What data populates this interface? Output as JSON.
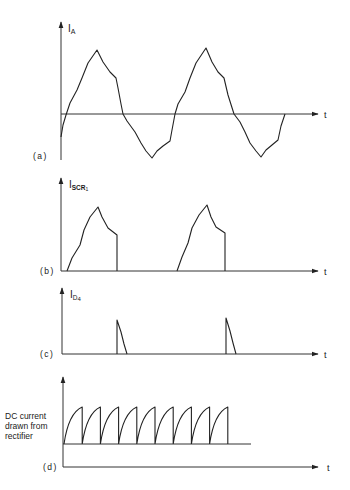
{
  "figure": {
    "panels": [
      {
        "id": "a",
        "tag": "(a)",
        "y_label": "I",
        "y_label_sub": "A",
        "x_label": "t",
        "description": "AC line current, quasi-sinusoidal with step notches, two cycles",
        "path": [
          [
            61,
            137
          ],
          [
            63,
            125
          ],
          [
            66,
            115
          ],
          [
            70,
            103
          ],
          [
            77,
            90
          ],
          [
            82,
            78
          ],
          [
            88,
            63
          ],
          [
            97,
            50
          ],
          [
            103,
            62
          ],
          [
            110,
            72
          ],
          [
            116,
            78
          ],
          [
            118,
            88
          ],
          [
            121,
            104
          ],
          [
            123,
            114
          ],
          [
            127,
            121
          ],
          [
            135,
            132
          ],
          [
            141,
            143
          ],
          [
            146,
            151
          ],
          [
            152,
            158
          ],
          [
            157,
            151
          ],
          [
            163,
            146
          ],
          [
            170,
            141
          ],
          [
            172,
            130
          ],
          [
            175,
            114
          ],
          [
            178,
            104
          ],
          [
            185,
            92
          ],
          [
            190,
            78
          ],
          [
            196,
            63
          ],
          [
            206,
            48
          ],
          [
            212,
            62
          ],
          [
            218,
            72
          ],
          [
            224,
            78
          ],
          [
            228,
            95
          ],
          [
            234,
            114
          ],
          [
            240,
            122
          ],
          [
            245,
            132
          ],
          [
            250,
            143
          ],
          [
            256,
            151
          ],
          [
            261,
            157
          ],
          [
            266,
            150
          ],
          [
            272,
            145
          ],
          [
            278,
            140
          ],
          [
            281,
            126
          ],
          [
            285,
            114
          ]
        ]
      },
      {
        "id": "b",
        "tag": "(b)",
        "y_label": "I",
        "y_label_sub": "SCR",
        "y_label_subsub": "1",
        "x_label": "t",
        "description": "SCR1 current: positive half-cycle pulses cut off abruptly",
        "pulses": [
          [
            [
              67,
              271
            ],
            [
              72,
              258
            ],
            [
              80,
              245
            ],
            [
              84,
              230
            ],
            [
              90,
              217
            ],
            [
              98,
              207
            ],
            [
              102,
              217
            ],
            [
              108,
              228
            ],
            [
              117,
              235
            ],
            [
              117,
              271
            ]
          ],
          [
            [
              177,
              271
            ],
            [
              182,
              257
            ],
            [
              188,
              243
            ],
            [
              192,
              228
            ],
            [
              199,
              215
            ],
            [
              207,
              205
            ],
            [
              211,
              217
            ],
            [
              216,
              227
            ],
            [
              225,
              233
            ],
            [
              225,
              271
            ]
          ]
        ]
      },
      {
        "id": "c",
        "tag": "(c)",
        "y_label": "I",
        "y_label_sub": "D",
        "y_label_subsub": "4",
        "x_label": "t",
        "description": "Diode D4 freewheeling current: short decaying spikes",
        "spikes": [
          [
            [
              117,
              354
            ],
            [
              117,
              320
            ],
            [
              121,
              332
            ],
            [
              124,
              344
            ],
            [
              127,
              354
            ]
          ],
          [
            [
              226,
              354
            ],
            [
              226,
              318
            ],
            [
              230,
              331
            ],
            [
              233,
              343
            ],
            [
              236,
              354
            ]
          ]
        ]
      },
      {
        "id": "d",
        "tag": "(d)",
        "side_label": [
          "DC current",
          "drawn from",
          "rectifier"
        ],
        "x_label": "t",
        "description": "Sawtooth DC current drawn from rectifier, 9 teeth",
        "teeth_count": 9,
        "teeth_start_x": 64,
        "teeth_period": 18.2,
        "teeth_base_y": 444,
        "teeth_top_y": 407,
        "baseline_end_x": 251
      }
    ]
  },
  "chart_data": {
    "type": "line",
    "title": "",
    "panels": [
      {
        "name": "(a) I_A",
        "ylabel": "I_A",
        "xlabel": "t",
        "shape": "notched sinusoid",
        "cycles": 2,
        "peak_positive": 1.0,
        "peak_negative": -0.67
      },
      {
        "name": "(b) I_SCR1",
        "ylabel": "I_SCR1",
        "xlabel": "t",
        "shape": "half-wave pulses with abrupt cutoff",
        "pulses": 2
      },
      {
        "name": "(c) I_D4",
        "ylabel": "I_D4",
        "xlabel": "t",
        "shape": "decaying spikes at SCR turn-off",
        "spikes": 2
      },
      {
        "name": "(d) DC current drawn from rectifier",
        "ylabel": "DC current drawn from rectifier",
        "xlabel": "t",
        "shape": "sawtooth",
        "teeth": 9
      }
    ]
  }
}
